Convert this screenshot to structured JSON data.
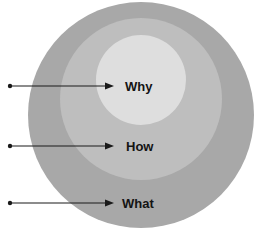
{
  "diagram": {
    "colors": {
      "outer": "#a8a8a8",
      "middle": "#bebebe",
      "inner": "#dedede",
      "arrow": "#1a1a1a",
      "text": "#141414",
      "background": "#ffffff"
    },
    "rings": [
      {
        "id": "outer",
        "label": "What"
      },
      {
        "id": "middle",
        "label": "How"
      },
      {
        "id": "inner",
        "label": "Why"
      }
    ],
    "labels": {
      "why": "Why",
      "how": "How",
      "what": "What"
    }
  }
}
